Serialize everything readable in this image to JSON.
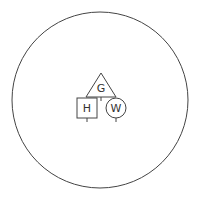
{
  "diagram": {
    "title": "",
    "colors": {
      "stroke": "#444444",
      "background": "#ffffff",
      "text": "#333333"
    },
    "outer_circle": {
      "cx": 100,
      "cy": 100,
      "r": 88
    },
    "nodes": [
      {
        "id": "G",
        "label": "G",
        "shape": "triangle"
      },
      {
        "id": "H",
        "label": "H",
        "shape": "square"
      },
      {
        "id": "W",
        "label": "W",
        "shape": "circle"
      }
    ]
  }
}
